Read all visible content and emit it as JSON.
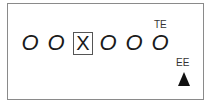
{
  "display": {
    "digits": [
      {
        "value": "O",
        "x": 21
      },
      {
        "value": "O",
        "x": 47
      },
      {
        "value": "O",
        "x": 99
      },
      {
        "value": "O",
        "x": 125
      },
      {
        "value": "O",
        "x": 151
      }
    ],
    "selected_digit": {
      "value": "X"
    },
    "labels": {
      "te": "TE",
      "ee": "EE"
    },
    "indicator": "up-triangle"
  }
}
